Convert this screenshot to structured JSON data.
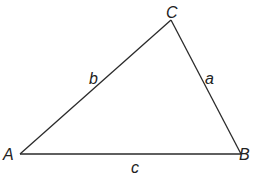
{
  "diagram": {
    "type": "triangle",
    "stroke_color": "#2a2a2a",
    "vertices": [
      {
        "id": "A",
        "label": "A",
        "x": 20,
        "y": 154
      },
      {
        "id": "B",
        "label": "B",
        "x": 241,
        "y": 154
      },
      {
        "id": "C",
        "label": "C",
        "x": 171,
        "y": 20
      }
    ],
    "sides": [
      {
        "id": "a",
        "label": "a",
        "from": "B",
        "to": "C"
      },
      {
        "id": "b",
        "label": "b",
        "from": "A",
        "to": "C"
      },
      {
        "id": "c",
        "label": "c",
        "from": "A",
        "to": "B"
      }
    ]
  }
}
